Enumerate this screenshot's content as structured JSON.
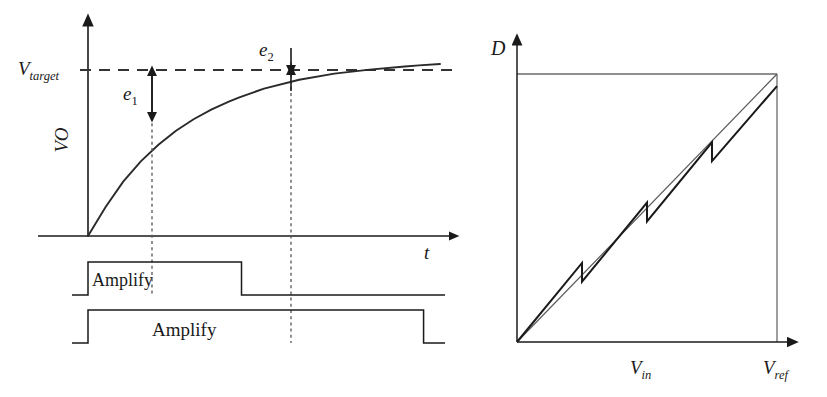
{
  "figure": {
    "title": "",
    "background_color": "#ffffff",
    "stroke_color": "#1a1a1a",
    "thin_stroke_color": "#555555"
  },
  "left_panel": {
    "name": "settling-waveform-timing-diagram",
    "axes": {
      "y_axis_label": "VO",
      "x_axis_label": "t",
      "target_level_label_base": "V",
      "target_level_label_sub": "target"
    },
    "annotations": [
      {
        "base": "e",
        "sub": "1",
        "meaning": "residual-settling-error-phase-1"
      },
      {
        "base": "e",
        "sub": "2",
        "meaning": "residual-settling-error-phase-2"
      }
    ],
    "pulses": [
      {
        "label": "Amplify",
        "phase": "short-amplify-pulse"
      },
      {
        "label": "Amplify",
        "phase": "long-amplify-pulse"
      }
    ]
  },
  "right_panel": {
    "name": "adc-transfer-characteristic",
    "axes": {
      "y_axis_label": "D",
      "x_axis_mid_label_base": "V",
      "x_axis_mid_label_sub": "in",
      "x_axis_end_label_base": "V",
      "x_axis_end_label_sub": "ref"
    }
  },
  "chart_data": [
    {
      "type": "line",
      "name": "settling-waveform",
      "title": "",
      "xlabel": "t",
      "ylabel": "VO",
      "grid": false,
      "legend": "none",
      "xlim": [
        0,
        1
      ],
      "ylim": [
        0,
        1.12
      ],
      "annotations": {
        "target_line_y": 1.0,
        "target_line_label": "V_target",
        "marker_1_x": 0.43,
        "marker_1_y": 0.79,
        "error_1_label": "e_1",
        "marker_2_x": 0.94,
        "marker_2_y": 0.975,
        "error_2_label": "e_2"
      },
      "series": [
        {
          "name": "VO exponential settling",
          "x": [
            0.0,
            0.05,
            0.1,
            0.15,
            0.2,
            0.25,
            0.3,
            0.35,
            0.4,
            0.43,
            0.5,
            0.6,
            0.7,
            0.8,
            0.9,
            0.94,
            1.0
          ],
          "y": [
            0.0,
            0.165,
            0.31,
            0.425,
            0.52,
            0.6,
            0.665,
            0.72,
            0.765,
            0.79,
            0.84,
            0.89,
            0.925,
            0.948,
            0.966,
            0.972,
            0.98
          ]
        }
      ]
    },
    {
      "type": "line",
      "name": "amplify-phase-1-pulse",
      "title": "",
      "xlabel": "t",
      "ylabel": "",
      "grid": false,
      "legend": "none",
      "label": "Amplify",
      "x": [
        0.0,
        0.0,
        0.43,
        0.43,
        1.0
      ],
      "y": [
        0,
        1,
        1,
        0,
        0
      ]
    },
    {
      "type": "line",
      "name": "amplify-phase-2-pulse",
      "title": "",
      "xlabel": "t",
      "ylabel": "",
      "grid": false,
      "legend": "none",
      "label": "Amplify",
      "x": [
        0.0,
        0.0,
        0.94,
        0.94,
        1.0
      ],
      "y": [
        0,
        1,
        1,
        0,
        0
      ]
    },
    {
      "type": "line",
      "name": "adc-transfer-curve",
      "title": "",
      "xlabel": "V_ref",
      "ylabel": "D",
      "grid": false,
      "legend": "none",
      "xlim": [
        0,
        1
      ],
      "ylim": [
        0,
        1
      ],
      "series": [
        {
          "name": "ideal-linear-transfer",
          "x": [
            0.0,
            1.0
          ],
          "y": [
            0.0,
            1.0
          ]
        },
        {
          "name": "segmented-transfer-with-gain-error",
          "x": [
            0.0,
            0.25,
            0.25,
            0.5,
            0.5,
            0.75,
            0.75,
            1.0
          ],
          "y": [
            0.0,
            0.295,
            0.225,
            0.52,
            0.45,
            0.745,
            0.675,
            0.955
          ]
        }
      ]
    }
  ]
}
